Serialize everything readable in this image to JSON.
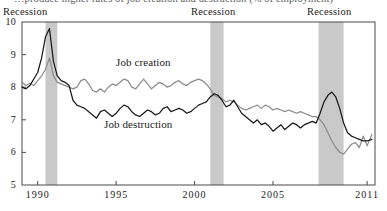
{
  "caption": "…produce higher rates of job creation and destruction (% of employment)",
  "annotations": {
    "recession_1": "Recession",
    "recession_2": "Recession",
    "recession_3": "Recession"
  },
  "series_labels": {
    "creation": "Job creation",
    "destruction": "Job destruction"
  },
  "colors": {
    "job_creation": "#8c8c8c",
    "job_destruction": "#1a1a1a",
    "recession_band": "#c9c9c9",
    "axis": "#4a4a4a",
    "background": "#ffffff"
  },
  "chart_data": {
    "type": "line",
    "title": "…produce higher rates of job creation and destruction (% of employment)",
    "xlabel": "",
    "ylabel": "% of employment",
    "xlim": [
      1989.0,
      2011.5
    ],
    "ylim": [
      5,
      10
    ],
    "grid": false,
    "legend": "inline-annotations",
    "xticks": [
      1990,
      1995,
      2000,
      2005,
      2011
    ],
    "xtick_labels": [
      "1990",
      "1995",
      "2000",
      "2005",
      "2011"
    ],
    "yticks": [
      5,
      6,
      7,
      8,
      9,
      10
    ],
    "ytick_labels": [
      "5",
      "6",
      "7",
      "8",
      "9",
      "10"
    ],
    "recession_bands": [
      {
        "label": "Recession",
        "start": 1990.5,
        "end": 1991.25
      },
      {
        "label": "Recession",
        "start": 2001.0,
        "end": 2001.85
      },
      {
        "label": "Recession",
        "start": 2007.9,
        "end": 2009.5
      }
    ],
    "series": [
      {
        "name": "Job creation",
        "color": "#8c8c8c",
        "x": [
          1989.0,
          1989.25,
          1989.5,
          1989.75,
          1990.0,
          1990.25,
          1990.5,
          1990.75,
          1991.0,
          1991.25,
          1991.5,
          1991.75,
          1992.0,
          1992.25,
          1992.5,
          1992.75,
          1993.0,
          1993.25,
          1993.5,
          1993.75,
          1994.0,
          1994.25,
          1994.5,
          1994.75,
          1995.0,
          1995.25,
          1995.5,
          1995.75,
          1996.0,
          1996.25,
          1996.5,
          1996.75,
          1997.0,
          1997.25,
          1997.5,
          1997.75,
          1998.0,
          1998.25,
          1998.5,
          1998.75,
          1999.0,
          1999.25,
          1999.5,
          1999.75,
          2000.0,
          2000.25,
          2000.5,
          2000.75,
          2001.0,
          2001.25,
          2001.5,
          2001.75,
          2002.0,
          2002.25,
          2002.5,
          2002.75,
          2003.0,
          2003.25,
          2003.5,
          2003.75,
          2004.0,
          2004.25,
          2004.5,
          2004.75,
          2005.0,
          2005.25,
          2005.5,
          2005.75,
          2006.0,
          2006.25,
          2006.5,
          2006.75,
          2007.0,
          2007.25,
          2007.5,
          2007.75,
          2008.0,
          2008.25,
          2008.5,
          2008.75,
          2009.0,
          2009.25,
          2009.5,
          2009.75,
          2010.0,
          2010.25,
          2010.5,
          2010.75,
          2011.0,
          2011.3
        ],
        "y": [
          8.15,
          8.05,
          8.12,
          8.05,
          8.2,
          8.35,
          8.55,
          8.9,
          8.35,
          8.15,
          8.1,
          8.05,
          8.0,
          7.95,
          8.0,
          8.2,
          8.25,
          8.1,
          7.9,
          7.85,
          7.95,
          7.85,
          8.0,
          8.1,
          8.05,
          8.15,
          8.25,
          8.2,
          8.0,
          7.95,
          8.1,
          8.25,
          8.1,
          7.95,
          8.05,
          8.15,
          8.1,
          8.0,
          8.05,
          8.15,
          8.2,
          8.1,
          8.05,
          8.15,
          8.2,
          8.25,
          8.2,
          8.1,
          7.95,
          7.75,
          7.7,
          7.65,
          7.55,
          7.6,
          7.55,
          7.45,
          7.35,
          7.3,
          7.35,
          7.4,
          7.45,
          7.35,
          7.45,
          7.4,
          7.3,
          7.35,
          7.3,
          7.25,
          7.3,
          7.25,
          7.2,
          7.25,
          7.2,
          7.15,
          7.1,
          7.1,
          7.0,
          6.85,
          6.6,
          6.35,
          6.15,
          6.0,
          5.95,
          6.1,
          6.25,
          6.3,
          6.15,
          6.5,
          6.2,
          6.55
        ]
      },
      {
        "name": "Job destruction",
        "color": "#1a1a1a",
        "x": [
          1989.0,
          1989.25,
          1989.5,
          1989.75,
          1990.0,
          1990.25,
          1990.5,
          1990.75,
          1991.0,
          1991.25,
          1991.5,
          1991.75,
          1992.0,
          1992.25,
          1992.5,
          1992.75,
          1993.0,
          1993.25,
          1993.5,
          1993.75,
          1994.0,
          1994.25,
          1994.5,
          1994.75,
          1995.0,
          1995.25,
          1995.5,
          1995.75,
          1996.0,
          1996.25,
          1996.5,
          1996.75,
          1997.0,
          1997.25,
          1997.5,
          1997.75,
          1998.0,
          1998.25,
          1998.5,
          1998.75,
          1999.0,
          1999.25,
          1999.5,
          1999.75,
          2000.0,
          2000.25,
          2000.5,
          2000.75,
          2001.0,
          2001.25,
          2001.5,
          2001.75,
          2002.0,
          2002.25,
          2002.5,
          2002.75,
          2003.0,
          2003.25,
          2003.5,
          2003.75,
          2004.0,
          2004.25,
          2004.5,
          2004.75,
          2005.0,
          2005.25,
          2005.5,
          2005.75,
          2006.0,
          2006.25,
          2006.5,
          2006.75,
          2007.0,
          2007.25,
          2007.5,
          2007.75,
          2008.0,
          2008.25,
          2008.5,
          2008.75,
          2009.0,
          2009.25,
          2009.5,
          2009.75,
          2010.0,
          2010.25,
          2010.5,
          2010.75,
          2011.0,
          2011.3
        ],
        "y": [
          8.0,
          7.95,
          8.05,
          8.25,
          8.45,
          8.9,
          9.55,
          9.8,
          8.8,
          8.35,
          8.2,
          8.15,
          8.05,
          7.6,
          7.45,
          7.4,
          7.35,
          7.25,
          7.15,
          7.05,
          7.25,
          7.3,
          7.2,
          7.1,
          7.2,
          7.35,
          7.45,
          7.4,
          7.25,
          7.15,
          7.1,
          7.2,
          7.3,
          7.25,
          7.15,
          7.2,
          7.35,
          7.4,
          7.25,
          7.3,
          7.35,
          7.3,
          7.2,
          7.25,
          7.35,
          7.45,
          7.5,
          7.55,
          7.7,
          7.8,
          7.75,
          7.6,
          7.4,
          7.45,
          7.6,
          7.4,
          7.2,
          7.1,
          7.0,
          6.9,
          7.0,
          6.85,
          6.9,
          6.8,
          6.65,
          6.75,
          6.85,
          6.7,
          6.8,
          6.9,
          6.85,
          6.75,
          6.85,
          6.9,
          6.95,
          6.9,
          7.2,
          7.55,
          7.75,
          7.85,
          7.7,
          7.35,
          6.9,
          6.6,
          6.5,
          6.45,
          6.4,
          6.35,
          6.35,
          6.4
        ]
      }
    ]
  }
}
